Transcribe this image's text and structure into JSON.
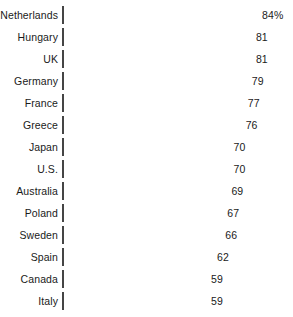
{
  "chart_data": {
    "type": "bar",
    "orientation": "horizontal",
    "title": "",
    "subtitle": "",
    "xlabel": "",
    "ylabel": "",
    "grid": false,
    "legend": null,
    "axis_visible": false,
    "tick_labels": [],
    "value_suffix_first": "%",
    "categories": [
      "Netherlands",
      "Hungary",
      "UK",
      "Germany",
      "France",
      "Greece",
      "Japan",
      "U.S.",
      "Australia",
      "Poland",
      "Sweden",
      "Spain",
      "Canada",
      "Italy"
    ],
    "values": [
      84,
      81,
      81,
      79,
      77,
      76,
      70,
      70,
      69,
      67,
      66,
      62,
      59,
      59
    ],
    "value_labels": [
      "84%",
      "81",
      "81",
      "79",
      "77",
      "76",
      "70",
      "70",
      "69",
      "67",
      "66",
      "62",
      "59",
      "59"
    ],
    "xlim": [
      0,
      84
    ],
    "bar_color": "#9d9d9d",
    "bar_border_color": "#454545",
    "text_color": "#1a1a1a",
    "background_color": "#ffffff"
  },
  "layout": {
    "bar_left_px": 62,
    "bar_height_px": 18,
    "row_pitch_px": 22,
    "top_offset_px": 6,
    "px_per_unit": 2.04,
    "value_origin": 59,
    "base_width_px": 143,
    "label_gap_px": 6
  }
}
